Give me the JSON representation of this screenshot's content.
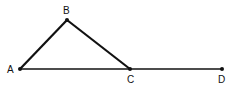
{
  "diagram": {
    "points": {
      "A": {
        "label": "A",
        "x": 20,
        "y": 69
      },
      "B": {
        "label": "B",
        "x": 67,
        "y": 20
      },
      "C": {
        "label": "C",
        "x": 130,
        "y": 69
      },
      "D": {
        "label": "D",
        "x": 222,
        "y": 69
      }
    },
    "segments": [
      "AB",
      "BC",
      "AD"
    ],
    "colors": {
      "stroke": "#111111",
      "background": "#ffffff"
    }
  }
}
